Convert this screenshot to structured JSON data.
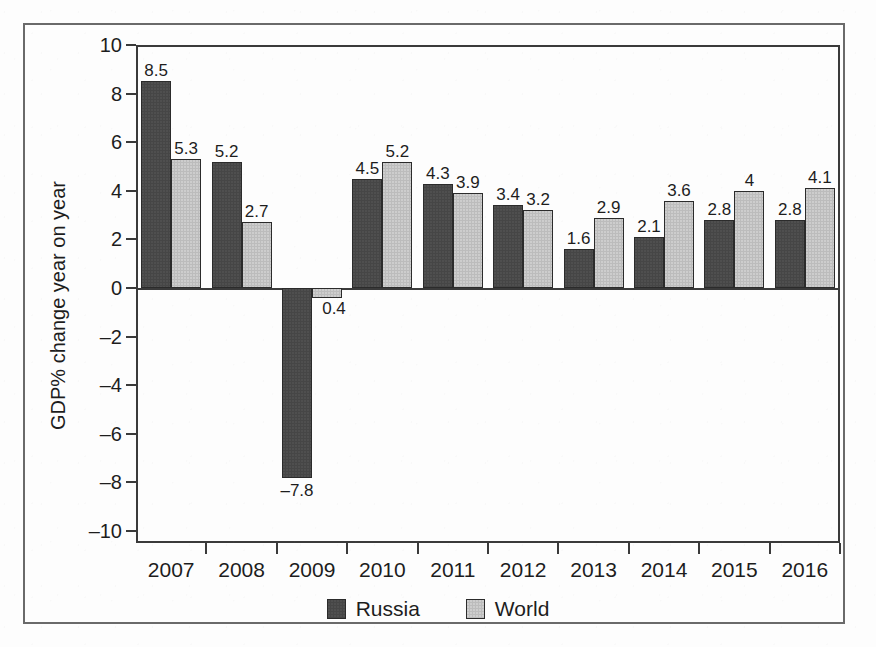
{
  "chart_data": {
    "type": "bar",
    "title": "",
    "subtitle": "",
    "xlabel": "",
    "ylabel": "GDP% change year on year",
    "categories": [
      "2007",
      "2008",
      "2009",
      "2010",
      "2011",
      "2012",
      "2013",
      "2014",
      "2015",
      "2016"
    ],
    "series": [
      {
        "name": "Russia",
        "color": "#464646",
        "values": [
          8.5,
          5.2,
          -7.8,
          4.5,
          4.3,
          3.4,
          1.6,
          2.1,
          2.8,
          2.8
        ],
        "labels": [
          "8.5",
          "5.2",
          "–7.8",
          "4.5",
          "4.3",
          "3.4",
          "1.6",
          "2.1",
          "2.8",
          "2.8"
        ]
      },
      {
        "name": "World",
        "color": "#bcbcbc",
        "values": [
          5.3,
          2.7,
          -0.4,
          5.2,
          3.9,
          3.2,
          2.9,
          3.6,
          4.0,
          4.1
        ],
        "labels": [
          "5.3",
          "2.7",
          "0.4",
          "5.2",
          "3.9",
          "3.2",
          "2.9",
          "3.6",
          "4",
          "4.1"
        ]
      }
    ],
    "ylim": [
      -10,
      10
    ],
    "yticks": [
      10,
      8,
      6,
      4,
      2,
      0,
      -2,
      -4,
      -6,
      -8,
      -10
    ],
    "ytick_labels": [
      "10",
      "8",
      "6",
      "4",
      "2",
      "0",
      "–2",
      "–4",
      "–6",
      "–8",
      "–10"
    ],
    "grid": false,
    "legend_position": "bottom"
  },
  "legend": {
    "items": [
      {
        "label": "Russia",
        "swatch": "russia"
      },
      {
        "label": "World",
        "swatch": "world"
      }
    ]
  },
  "axis": {
    "y_title": "GDP% change year on year"
  }
}
